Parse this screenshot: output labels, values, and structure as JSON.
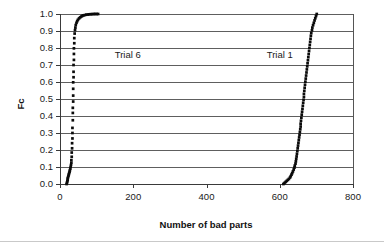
{
  "chart_data": {
    "type": "scatter",
    "title": "",
    "xlabel": "Number of bad parts",
    "ylabel": "Fc",
    "xlim": [
      0,
      800
    ],
    "ylim": [
      0.0,
      1.0
    ],
    "xticks": [
      "0",
      "200",
      "400",
      "600",
      "800"
    ],
    "xtick_values": [
      0,
      200,
      400,
      600,
      800
    ],
    "yticks": [
      "0.0",
      "0.1",
      "0.2",
      "0.3",
      "0.4",
      "0.5",
      "0.6",
      "0.7",
      "0.8",
      "0.9",
      "1.0"
    ],
    "ytick_values": [
      0.0,
      0.1,
      0.2,
      0.3,
      0.4,
      0.5,
      0.6,
      0.7,
      0.8,
      0.9,
      1.0
    ],
    "grid": "horizontal",
    "legend_position": "inline-annotations",
    "marker_color": "#0a0a0a",
    "marker_shape": "square",
    "annotations": [
      {
        "text": "Trial 6",
        "x": 185,
        "y": 0.76
      },
      {
        "text": "Trial 1",
        "x": 600,
        "y": 0.76
      }
    ],
    "series": [
      {
        "name": "Trial 6",
        "points": [
          [
            18,
            0.0
          ],
          [
            19,
            0.008
          ],
          [
            20,
            0.016
          ],
          [
            21,
            0.024
          ],
          [
            21,
            0.032
          ],
          [
            22,
            0.04
          ],
          [
            23,
            0.048
          ],
          [
            24,
            0.056
          ],
          [
            25,
            0.064
          ],
          [
            26,
            0.072
          ],
          [
            27,
            0.08
          ],
          [
            28,
            0.09
          ],
          [
            29,
            0.1
          ],
          [
            30,
            0.112
          ],
          [
            31,
            0.125
          ],
          [
            31,
            0.14
          ],
          [
            32,
            0.16
          ],
          [
            32,
            0.185
          ],
          [
            33,
            0.21
          ],
          [
            33,
            0.24
          ],
          [
            34,
            0.268
          ],
          [
            34,
            0.3
          ],
          [
            34,
            0.33
          ],
          [
            35,
            0.375
          ],
          [
            35,
            0.418
          ],
          [
            35,
            0.448
          ],
          [
            36,
            0.485
          ],
          [
            36,
            0.52
          ],
          [
            36,
            0.56
          ],
          [
            36,
            0.598
          ],
          [
            37,
            0.628
          ],
          [
            37,
            0.66
          ],
          [
            37,
            0.7
          ],
          [
            38,
            0.73
          ],
          [
            38,
            0.765
          ],
          [
            38,
            0.798
          ],
          [
            39,
            0.828
          ],
          [
            39,
            0.858
          ],
          [
            40,
            0.885
          ],
          [
            41,
            0.905
          ],
          [
            42,
            0.92
          ],
          [
            43,
            0.935
          ],
          [
            45,
            0.948
          ],
          [
            47,
            0.958
          ],
          [
            49,
            0.966
          ],
          [
            52,
            0.974
          ],
          [
            55,
            0.98
          ],
          [
            58,
            0.985
          ],
          [
            61,
            0.989
          ],
          [
            64,
            0.992
          ],
          [
            68,
            0.994
          ],
          [
            72,
            0.996
          ],
          [
            76,
            0.997
          ],
          [
            80,
            0.998
          ],
          [
            84,
            0.999
          ],
          [
            88,
            0.999
          ],
          [
            92,
            1.0
          ],
          [
            96,
            1.0
          ],
          [
            100,
            1.0
          ],
          [
            104,
            1.0
          ]
        ]
      },
      {
        "name": "Trial 1",
        "points": [
          [
            610,
            0.0
          ],
          [
            613,
            0.006
          ],
          [
            616,
            0.012
          ],
          [
            619,
            0.018
          ],
          [
            622,
            0.024
          ],
          [
            625,
            0.03
          ],
          [
            628,
            0.038
          ],
          [
            630,
            0.046
          ],
          [
            632,
            0.055
          ],
          [
            634,
            0.064
          ],
          [
            636,
            0.074
          ],
          [
            638,
            0.085
          ],
          [
            640,
            0.096
          ],
          [
            641,
            0.108
          ],
          [
            643,
            0.12
          ],
          [
            644,
            0.133
          ],
          [
            645,
            0.148
          ],
          [
            646,
            0.162
          ],
          [
            647,
            0.178
          ],
          [
            648,
            0.194
          ],
          [
            649,
            0.21
          ],
          [
            650,
            0.226
          ],
          [
            651,
            0.242
          ],
          [
            652,
            0.258
          ],
          [
            653,
            0.274
          ],
          [
            654,
            0.29
          ],
          [
            655,
            0.306
          ],
          [
            656,
            0.322
          ],
          [
            657,
            0.338
          ],
          [
            657,
            0.355
          ],
          [
            658,
            0.372
          ],
          [
            659,
            0.39
          ],
          [
            660,
            0.408
          ],
          [
            661,
            0.425
          ],
          [
            662,
            0.442
          ],
          [
            663,
            0.46
          ],
          [
            664,
            0.478
          ],
          [
            665,
            0.495
          ],
          [
            666,
            0.512
          ],
          [
            666,
            0.53
          ],
          [
            667,
            0.548
          ],
          [
            668,
            0.566
          ],
          [
            669,
            0.584
          ],
          [
            670,
            0.602
          ],
          [
            671,
            0.62
          ],
          [
            672,
            0.638
          ],
          [
            673,
            0.656
          ],
          [
            674,
            0.674
          ],
          [
            675,
            0.692
          ],
          [
            676,
            0.71
          ],
          [
            677,
            0.728
          ],
          [
            678,
            0.746
          ],
          [
            679,
            0.764
          ],
          [
            680,
            0.782
          ],
          [
            681,
            0.8
          ],
          [
            682,
            0.818
          ],
          [
            683,
            0.836
          ],
          [
            684,
            0.854
          ],
          [
            685,
            0.872
          ],
          [
            686,
            0.888
          ],
          [
            688,
            0.904
          ],
          [
            689,
            0.92
          ],
          [
            691,
            0.934
          ],
          [
            693,
            0.948
          ],
          [
            695,
            0.962
          ],
          [
            697,
            0.975
          ],
          [
            699,
            0.988
          ],
          [
            701,
            1.0
          ]
        ]
      }
    ]
  }
}
